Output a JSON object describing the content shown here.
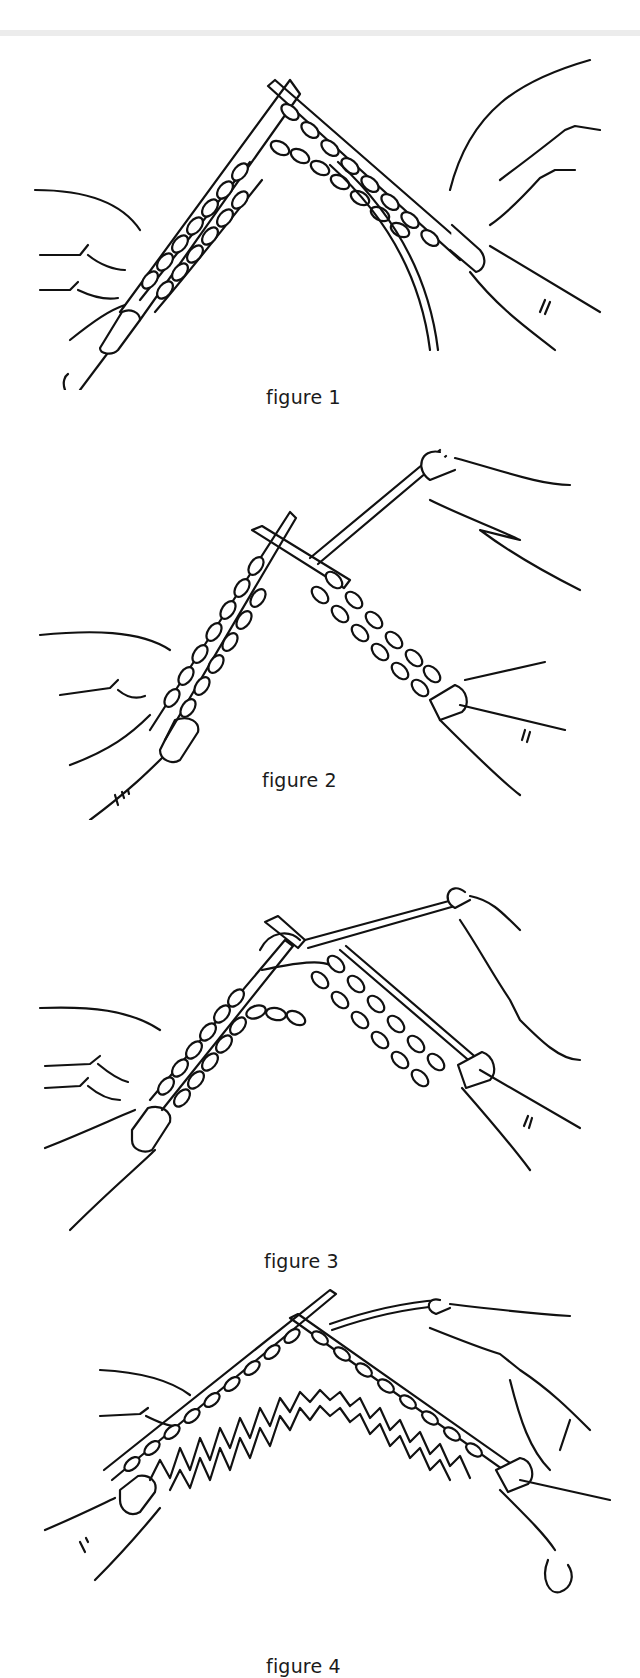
{
  "page": {
    "background": "#ffffff",
    "line_color": "#111111"
  },
  "figures": [
    {
      "caption": "figure 1",
      "illustration": "Knitting on two needles: left needle held by left hand, right needle inserted, yarn hanging down from the middle stitches"
    },
    {
      "caption": "figure 2",
      "illustration": "Right needle crossing behind left needle, yarn wrapped over right index finger"
    },
    {
      "caption": "figure 3",
      "illustration": "Yarn wrapped around right needle tip, new loop being formed between needles"
    },
    {
      "caption": "figure 4",
      "illustration": "Stitches transferred with knitted fabric hanging below both needles; yarn over right hand"
    }
  ]
}
